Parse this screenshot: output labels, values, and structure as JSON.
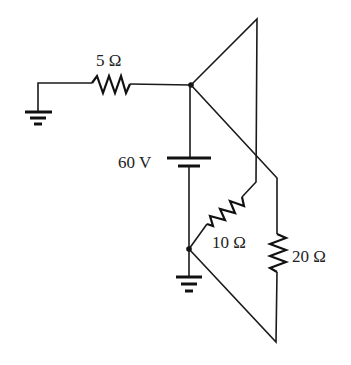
{
  "diagram": {
    "type": "circuit",
    "components": {
      "r1": {
        "label": "5 Ω",
        "kind": "resistor"
      },
      "battery": {
        "label": "60 V",
        "kind": "battery"
      },
      "r2": {
        "label": "10 Ω",
        "kind": "resistor"
      },
      "r3": {
        "label": "20 Ω",
        "kind": "resistor"
      },
      "ground_left": {
        "kind": "ground"
      },
      "ground_bottom": {
        "kind": "ground"
      }
    },
    "nodes": [
      "top-junction",
      "bottom-junction"
    ],
    "colors": {
      "stroke": "#1a1a1a",
      "background": "#ffffff"
    }
  }
}
